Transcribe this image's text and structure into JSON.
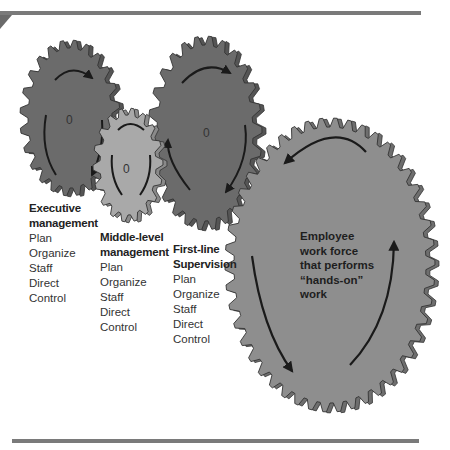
{
  "figure": {
    "type": "gear-diagram",
    "colors": {
      "dark_gear": "#6b6b6b",
      "light_gear": "#a9a9a9",
      "employee_gear": "#8e8e8e",
      "rule": "#7a7a7a",
      "arrow": "#1a1a1a"
    },
    "gears": [
      {
        "id": "executive",
        "center_mark": "0",
        "title_lines": [
          "Executive",
          "management"
        ],
        "functions": [
          "Plan",
          "Organize",
          "Staff",
          "Direct",
          "Control"
        ]
      },
      {
        "id": "middle",
        "center_mark": "0",
        "title_lines": [
          "Middle-level",
          "management"
        ],
        "functions": [
          "Plan",
          "Organize",
          "Staff",
          "Direct",
          "Control"
        ]
      },
      {
        "id": "first-line",
        "center_mark": "0",
        "title_lines": [
          "First-line",
          "Supervision"
        ],
        "functions": [
          "Plan",
          "Organize",
          "Staff",
          "Direct",
          "Control"
        ]
      },
      {
        "id": "employee",
        "lines": [
          "Employee",
          "work force",
          "that performs",
          "“hands-on”",
          "work"
        ]
      }
    ]
  }
}
